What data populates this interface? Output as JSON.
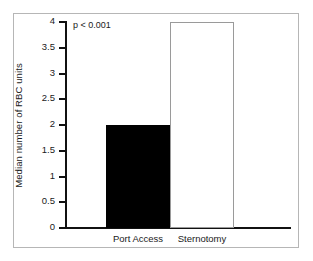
{
  "chart_data": {
    "type": "bar",
    "title": "",
    "xlabel": "",
    "ylabel": "Median number of RBC units",
    "categories": [
      "Port Access",
      "Sternotomy"
    ],
    "values": [
      2,
      4
    ],
    "ylim": [
      0,
      4
    ],
    "ytick_labels": [
      "0",
      "0.5",
      "1",
      "1.5",
      "2",
      "2.5",
      "3",
      "3.5",
      "4"
    ],
    "ytick_values": [
      0,
      0.5,
      1,
      1.5,
      2,
      2.5,
      3,
      3.5,
      4
    ],
    "grid": false,
    "legend": "none",
    "annotations": [
      {
        "text": "p < 0.001",
        "x": 0.05,
        "y": 3.9
      }
    ],
    "series": [
      {
        "name": "Median RBC units",
        "values": [
          2,
          4
        ],
        "bar_styles": [
          "filled-black",
          "hollow-white"
        ]
      }
    ],
    "colors": {
      "bar_filled": "#000000",
      "bar_hollow_face": "#ffffff",
      "bar_hollow_edge": "#9a9a9a",
      "axis": "#111111",
      "frame": "#b6b6b6",
      "text": "#1a1a1a",
      "background": "#ffffff"
    }
  }
}
